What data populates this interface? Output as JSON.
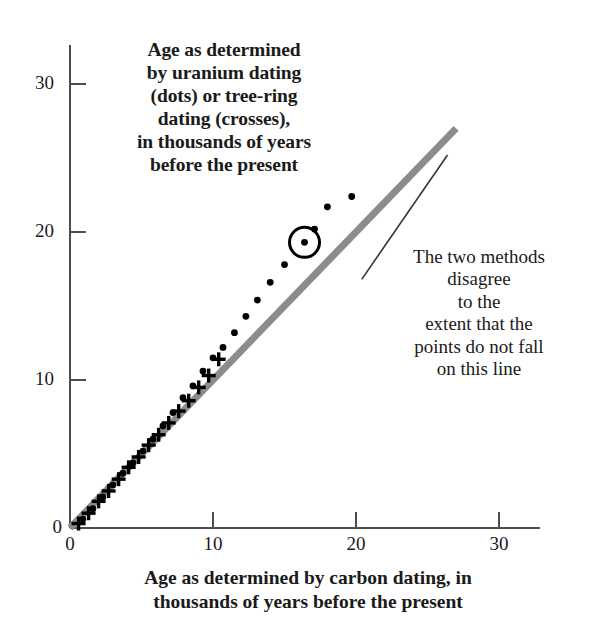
{
  "figure": {
    "title_note": [
      "Age as determined",
      "by uranium dating",
      "(dots) or tree-ring",
      "dating (crosses),",
      "in thousands of years",
      "before the present"
    ],
    "side_note": [
      "The two methods",
      "disagree",
      "to the",
      "extent that the",
      "points do not fall",
      "on this line"
    ],
    "x_axis_label": [
      "Age as determined by carbon dating, in",
      "thousands of years before the present"
    ],
    "colors": {
      "line": "#8c8c8c",
      "marker": "#000000",
      "axis": "#4d4d4d",
      "text": "#1a1a1a"
    }
  },
  "chart_data": {
    "type": "scatter",
    "xlabel": "Age as determined by carbon dating, in thousands of years before the present",
    "ylabel": "Age as determined by uranium dating (dots) or tree-ring dating (crosses), in thousands of years before the present",
    "xlim": [
      0,
      34
    ],
    "ylim": [
      0,
      32
    ],
    "xticks": [
      0,
      10,
      20,
      30
    ],
    "yticks": [
      0,
      10,
      20,
      30
    ],
    "grid": false,
    "legend": "none (series identified in axis note: dots = uranium dating, crosses = tree-ring dating)",
    "reference_line": {
      "name": "this line",
      "description": "1:1 agreement line",
      "x": [
        0,
        27
      ],
      "y": [
        0,
        27
      ],
      "color": "#8c8c8c"
    },
    "annotations": [
      {
        "name": "circled-point",
        "x": 16.4,
        "y": 19.3,
        "note": "highlighted data point circled"
      },
      {
        "name": "leader-line",
        "from": [
          26.4,
          25.2
        ],
        "to": [
          20.4,
          16.8
        ],
        "note": "points from side note to the reference line"
      }
    ],
    "series": [
      {
        "name": "tree-ring dating",
        "marker": "cross",
        "points": [
          [
            0.6,
            0.3
          ],
          [
            1.3,
            1.0
          ],
          [
            2.0,
            1.8
          ],
          [
            2.7,
            2.5
          ],
          [
            3.4,
            3.3
          ],
          [
            4.1,
            4.1
          ],
          [
            4.8,
            4.8
          ],
          [
            5.5,
            5.6
          ],
          [
            6.2,
            6.3
          ],
          [
            6.9,
            7.1
          ],
          [
            7.6,
            7.9
          ],
          [
            8.3,
            8.6
          ],
          [
            9.0,
            9.5
          ],
          [
            9.7,
            10.3
          ],
          [
            10.4,
            11.4
          ]
        ]
      },
      {
        "name": "uranium dating",
        "marker": "dot",
        "points": [
          [
            0.9,
            0.6
          ],
          [
            1.6,
            1.3
          ],
          [
            2.3,
            2.1
          ],
          [
            3.0,
            2.9
          ],
          [
            3.7,
            3.7
          ],
          [
            4.4,
            4.4
          ],
          [
            5.1,
            5.2
          ],
          [
            5.8,
            6.0
          ],
          [
            6.5,
            6.9
          ],
          [
            7.2,
            7.8
          ],
          [
            7.9,
            8.8
          ],
          [
            8.6,
            9.6
          ],
          [
            9.3,
            10.6
          ],
          [
            10.0,
            11.5
          ],
          [
            10.7,
            12.2
          ],
          [
            11.5,
            13.2
          ],
          [
            12.3,
            14.3
          ],
          [
            13.1,
            15.4
          ],
          [
            14.0,
            16.6
          ],
          [
            15.0,
            17.8
          ],
          [
            16.4,
            19.3
          ],
          [
            17.1,
            20.2
          ],
          [
            18.0,
            21.7
          ],
          [
            19.7,
            22.4
          ]
        ]
      }
    ]
  }
}
